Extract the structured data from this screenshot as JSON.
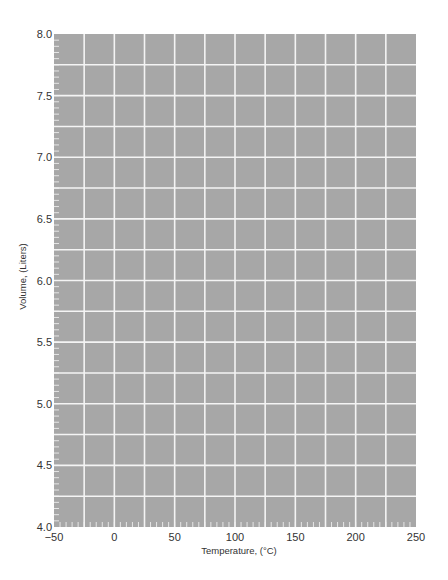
{
  "chart_data": {
    "type": "line",
    "title": "",
    "xlabel": "Temperature, (°C)",
    "ylabel": "Volume, (Liters)",
    "xlim": [
      -50,
      250
    ],
    "ylim": [
      4.0,
      8.0
    ],
    "x_ticks": [
      -50,
      0,
      50,
      100,
      150,
      200,
      250
    ],
    "x_tick_labels": [
      "−50",
      "0",
      "50",
      "100",
      "150",
      "200",
      "250"
    ],
    "y_ticks": [
      4.0,
      4.5,
      5.0,
      5.5,
      6.0,
      6.5,
      7.0,
      7.5,
      8.0
    ],
    "y_tick_labels": [
      "4.0",
      "4.5",
      "5.0",
      "5.5",
      "6.0",
      "6.5",
      "7.0",
      "7.5",
      "8.0"
    ],
    "x_major_grid_step": 25,
    "y_major_grid_step": 0.25,
    "x_minor_tick_step": 5,
    "y_minor_tick_step": 0.05,
    "grid": true,
    "series": [],
    "legend": null
  },
  "colors": {
    "plot_background": "#a7a7a7",
    "grid_line": "#f4f4f4",
    "minor_tick": "#e6e6e6",
    "text": "#333333"
  },
  "labels": {
    "x_axis_title": "Temperature, (°C)",
    "y_axis_title": "Volume, (Liters)"
  }
}
